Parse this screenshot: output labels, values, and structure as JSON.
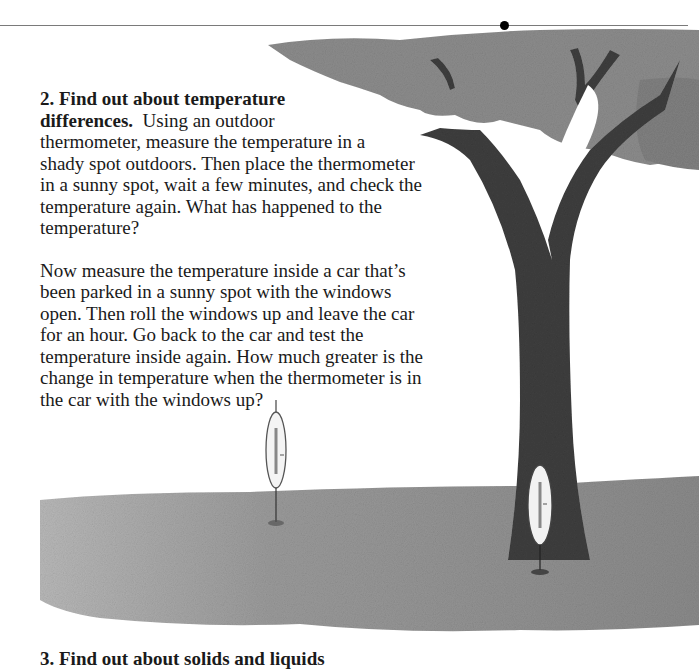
{
  "page": {
    "rule_color": "#7a7a7a",
    "section2": {
      "heading": "2. Find out about temperature differences.",
      "paragraph1_lines": [
        "Using an outdoor",
        "thermometer, measure the temperature in a",
        "shady spot outdoors. Then place the thermometer",
        "in a sunny spot, wait a few minutes, and check the",
        "temperature again. What has happened to the",
        "temperature?"
      ],
      "heading_line1": "2.  Find out about temperature",
      "heading_line2": "differences.",
      "paragraph2_lines": [
        "Now measure the temperature inside a car that’s",
        "been parked in a sunny spot with the windows",
        "open.  Then roll the windows up and leave the car",
        "for an hour.  Go back to the car and test the",
        "temperature inside again.  How much greater is the",
        "change in temperature when the thermometer is in",
        "the car with the windows up?"
      ]
    },
    "section3_clipped_heading": "3.  Find out about solids and liquids",
    "illustration": {
      "description": "Pencil drawing of a tree on grass with two thermometers, one in the sun and one in the shade",
      "trunk_color": "#3a3a3a",
      "foliage_color": "#8a8a8a",
      "grass_color": "#8f8f8f"
    }
  }
}
